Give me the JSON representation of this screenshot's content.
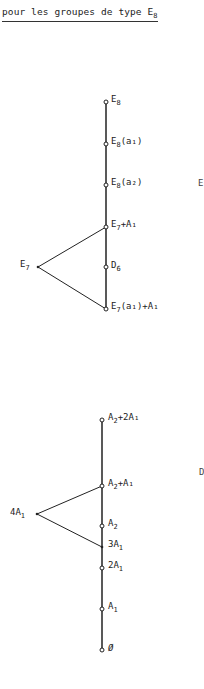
{
  "title": {
    "prefix": "pour les groupes de type E",
    "sub": "8"
  },
  "diagrams": [
    {
      "name": "E8-upper",
      "nodes": [
        {
          "id": "E8",
          "base": "E",
          "sub": "8",
          "rest": "",
          "x": 106,
          "y": 102
        },
        {
          "id": "E8(a1)",
          "base": "E",
          "sub": "8",
          "rest": "(a₁)",
          "x": 106,
          "y": 144
        },
        {
          "id": "E8(a2)",
          "base": "E",
          "sub": "8",
          "rest": "(a₂)",
          "x": 106,
          "y": 185
        },
        {
          "id": "E7+A1",
          "base": "E",
          "sub": "7",
          "rest": "+A₁",
          "x": 106,
          "y": 227
        },
        {
          "id": "D6",
          "base": "D",
          "sub": "6",
          "rest": "",
          "x": 106,
          "y": 267
        },
        {
          "id": "E7(a1)+A1",
          "base": "E",
          "sub": "7",
          "rest": "(a₁)+A₁",
          "x": 106,
          "y": 309
        }
      ],
      "side_node": {
        "id": "E7",
        "base": "E",
        "sub": "7",
        "x": 38,
        "y": 267
      }
    },
    {
      "name": "E8-lower",
      "nodes": [
        {
          "id": "A2+2A1",
          "base": "A",
          "sub": "2",
          "rest": "+2A₁",
          "x": 102,
          "y": 420
        },
        {
          "id": "A2+A1",
          "base": "A",
          "sub": "2",
          "rest": "+A₁",
          "x": 102,
          "y": 486
        },
        {
          "id": "A2",
          "base": "A",
          "sub": "2",
          "rest": "",
          "x": 102,
          "y": 526
        },
        {
          "id": "3A1",
          "base": "3A",
          "sub": "1",
          "rest": "",
          "x": 102,
          "y": 547
        },
        {
          "id": "2A1",
          "base": "2A",
          "sub": "1",
          "rest": "",
          "x": 102,
          "y": 568
        },
        {
          "id": "A1",
          "base": "A",
          "sub": "1",
          "rest": "",
          "x": 102,
          "y": 609
        },
        {
          "id": "empty",
          "base": "Ø",
          "sub": "",
          "rest": "",
          "x": 102,
          "y": 650
        }
      ],
      "side_node": {
        "id": "4A1",
        "base": "4A",
        "sub": "1",
        "x": 37,
        "y": 514
      }
    }
  ],
  "edge_fragments": {
    "upper_right": "E",
    "lower_right": "D"
  },
  "labels": {
    "E8": "E",
    "E8_sub": "8",
    "E8a1": "E",
    "E8a1_sub": "8",
    "E8a1_rest": "(a₁)",
    "E8a2": "E",
    "E8a2_sub": "8",
    "E8a2_rest": "(a₂)",
    "E7A1": "E",
    "E7A1_sub": "7",
    "E7A1_rest": "+A₁",
    "D6": "D",
    "D6_sub": "6",
    "E7a1A1": "E",
    "E7a1A1_sub": "7",
    "E7a1A1_rest": "(a₁)+A₁",
    "E7": "E",
    "E7_sub": "7",
    "A22A1": "A",
    "A22A1_sub": "2",
    "A22A1_rest": "+2A₁",
    "A2A1": "A",
    "A2A1_sub": "2",
    "A2A1_rest": "+A₁",
    "A2": "A",
    "A2_sub": "2",
    "3A1": "3A",
    "3A1_sub": "1",
    "2A1": "2A",
    "2A1_sub": "1",
    "A1": "A",
    "A1_sub": "1",
    "empty": "Ø",
    "4A1": "4A",
    "4A1_sub": "1"
  }
}
